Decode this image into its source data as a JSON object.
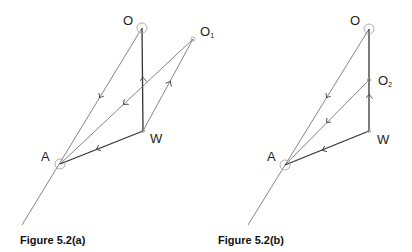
{
  "figures": [
    {
      "caption": "Figure 5.2(a)",
      "labels": {
        "O": "O",
        "O1_main": "O",
        "O1_sub": "1",
        "W": "W",
        "A": "A"
      }
    },
    {
      "caption": "Figure 5.2(b)",
      "labels": {
        "O": "O",
        "O2_main": "O",
        "O2_sub": "2",
        "W": "W",
        "A": "A"
      }
    }
  ],
  "colors": {
    "line": "#555555",
    "bold_line": "#333333",
    "circle": "#999999"
  }
}
